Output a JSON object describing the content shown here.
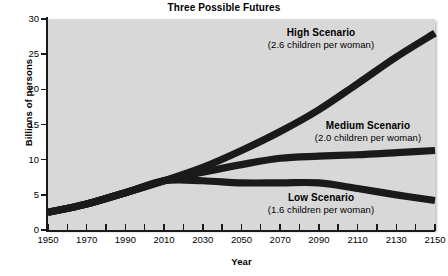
{
  "chart_data": {
    "type": "line",
    "title": "Three Possible Futures",
    "xlabel": "Year",
    "ylabel": "Billions of persons",
    "xlim": [
      1950,
      2150
    ],
    "ylim": [
      0,
      30
    ],
    "grid": false,
    "legend_position": "inline-annotations",
    "x_ticks": [
      1950,
      1970,
      1990,
      2010,
      2030,
      2050,
      2070,
      2090,
      2110,
      2130,
      2150
    ],
    "x_minor_tick_interval": 10,
    "y_ticks": [
      0,
      5,
      10,
      15,
      20,
      25,
      30
    ],
    "x": [
      1950,
      1970,
      1990,
      2010,
      2030,
      2050,
      2070,
      2090,
      2110,
      2130,
      2150
    ],
    "series": [
      {
        "name": "High Scenario",
        "subtitle": "(2.6 children per woman)",
        "color": "#1a1a1a",
        "values": [
          2.5,
          3.7,
          5.3,
          7.0,
          8.9,
          11.3,
          14.0,
          17.1,
          20.8,
          24.6,
          28.0
        ]
      },
      {
        "name": "Medium Scenario",
        "subtitle": "(2.0 children per woman)",
        "color": "#1a1a1a",
        "values": [
          2.5,
          3.7,
          5.3,
          7.0,
          8.2,
          9.3,
          10.2,
          10.5,
          10.7,
          11.0,
          11.3
        ]
      },
      {
        "name": "Low Scenario",
        "subtitle": "(1.6 children per woman)",
        "color": "#1a1a1a",
        "values": [
          2.5,
          3.7,
          5.3,
          7.0,
          7.0,
          6.7,
          6.7,
          6.7,
          5.9,
          5.0,
          4.2
        ]
      }
    ],
    "annotations": [
      {
        "label": "High Scenario",
        "sub": "(2.6 children per woman)"
      },
      {
        "label": "Medium Scenario",
        "sub": "(2.0 children per woman)"
      },
      {
        "label": "Low Scenario",
        "sub": "(1.6 children per woman)"
      }
    ],
    "colors": {
      "plot_background": "#d8d8d8",
      "page_background": "#ffffff",
      "line": "#1a1a1a",
      "axis": "#1a1a1a",
      "text": "#000000"
    }
  },
  "axis": {
    "y_labels": [
      "30",
      "25",
      "20",
      "15",
      "10",
      "5",
      "0"
    ],
    "x_labels": [
      "1950",
      "1970",
      "1990",
      "2010",
      "2030",
      "2050",
      "2070",
      "2090",
      "2110",
      "2130",
      "2150"
    ]
  }
}
